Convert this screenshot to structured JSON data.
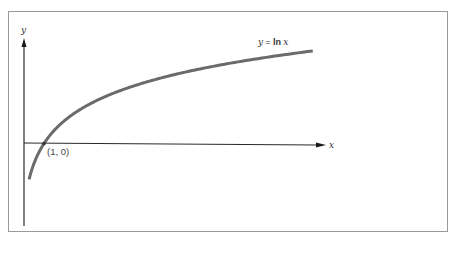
{
  "chart_data": {
    "type": "line",
    "title": "",
    "function": "y = ln x",
    "xlabel": "x",
    "ylabel": "y",
    "series": [
      {
        "name": "y = ln x",
        "x": [
          0.35,
          0.5,
          0.75,
          1,
          1.5,
          2,
          3,
          4,
          5,
          6,
          7,
          8,
          9,
          10,
          11,
          12
        ],
        "values": [
          -1.05,
          -0.69,
          -0.29,
          0,
          0.41,
          0.69,
          1.1,
          1.39,
          1.61,
          1.79,
          1.95,
          2.08,
          2.2,
          2.3,
          2.4,
          2.48
        ]
      }
    ],
    "annotations": [
      {
        "text": "(1, 0)",
        "x": 1,
        "y": 0
      },
      {
        "text": "y = ln x",
        "position": "near right end of curve"
      }
    ],
    "grid": false,
    "ticks": "none",
    "colors": {
      "curve": "#6b6b6b",
      "axes": "#2a2a2a",
      "frame": "#9a9a9a"
    }
  },
  "labels": {
    "y_axis": "y",
    "x_axis": "x",
    "point": "(1, 0)",
    "curve_y": "y",
    "curve_eq": " = ",
    "curve_ln": "ln",
    "curve_x": " x"
  }
}
